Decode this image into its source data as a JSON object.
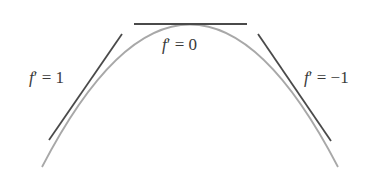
{
  "diagram": {
    "curve": {
      "type": "parabola",
      "color": "#a8a8a8",
      "start": [
        42,
        167
      ],
      "control": [
        195,
        -118
      ],
      "end": [
        338,
        167
      ]
    },
    "tangents": [
      {
        "id": "slope-positive",
        "slope_label": "f′ = 1",
        "from": [
          49,
          140
        ],
        "to": [
          122,
          34
        ],
        "color": "#4a4a4a"
      },
      {
        "id": "slope-zero",
        "slope_label": "f′ = 0",
        "from": [
          134,
          24
        ],
        "to": [
          247,
          24
        ],
        "color": "#4a4a4a"
      },
      {
        "id": "slope-negative",
        "slope_label": "f′ = −1",
        "from": [
          258,
          34
        ],
        "to": [
          331,
          141
        ],
        "color": "#4a4a4a"
      }
    ],
    "labels": {
      "left": {
        "func": "f",
        "rest": "′ = 1"
      },
      "top": {
        "func": "f",
        "rest": "′ = 0"
      },
      "right": {
        "func": "f",
        "rest": "′ = −1"
      }
    }
  }
}
